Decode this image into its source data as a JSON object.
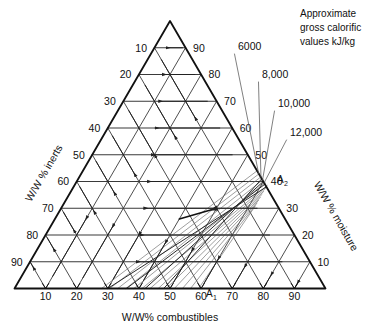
{
  "figure": {
    "type": "ternary-diagram",
    "background": "#ffffff",
    "ink": "#111111",
    "grid_color": "#3a3a3a",
    "calorific_line_color": "#6b6b6b"
  },
  "axes": {
    "left": {
      "title": "W/W % inerts",
      "ticks": [
        "10",
        "20",
        "30",
        "40",
        "50",
        "60",
        "70",
        "80",
        "90"
      ]
    },
    "right": {
      "title": "W/W % moisture",
      "ticks": [
        "90",
        "80",
        "70",
        "60",
        "50",
        "40",
        "30",
        "20",
        "10"
      ]
    },
    "bottom": {
      "title": "W/W% combustibles",
      "ticks": [
        "10",
        "20",
        "30",
        "40",
        "50",
        "60",
        "70",
        "80",
        "90"
      ]
    }
  },
  "legend": {
    "line1": "Approximate",
    "line2": "gross calorific",
    "line3": "values kJ/kg"
  },
  "calorific_labels": [
    {
      "text": "6000",
      "x": 238,
      "y": 50
    },
    {
      "text": "8,000",
      "x": 262,
      "y": 78
    },
    {
      "text": "10,000",
      "x": 278,
      "y": 107
    },
    {
      "text": "12,000",
      "x": 290,
      "y": 136
    }
  ],
  "points": [
    {
      "id": "A1",
      "base": "A",
      "sub": "1",
      "x": 206,
      "y": 297
    },
    {
      "id": "A2",
      "base": "A",
      "sub": "2",
      "x": 277,
      "y": 183
    }
  ],
  "chart_data": {
    "type": "ternary",
    "title": "Approximate gross calorific values kJ/kg",
    "components": [
      "combustibles",
      "inerts",
      "moisture"
    ],
    "axis_labels": {
      "bottom": "W/W% combustibles",
      "left": "W/W % inerts",
      "right": "W/W % moisture"
    },
    "tick_interval": 10,
    "tick_range": [
      10,
      90
    ],
    "grid": true,
    "contours": [
      {
        "label": "6000",
        "value": 6000,
        "units": "kJ/kg"
      },
      {
        "label": "8,000",
        "value": 8000,
        "units": "kJ/kg"
      },
      {
        "label": "10,000",
        "value": 10000,
        "units": "kJ/kg"
      },
      {
        "label": "12,000",
        "value": 12000,
        "units": "kJ/kg"
      }
    ],
    "annotated_points": [
      {
        "label": "A1",
        "combustibles": 64,
        "inerts": 0,
        "moisture": 36
      },
      {
        "label": "A2",
        "combustibles": 60,
        "inerts": 0,
        "moisture": 40
      }
    ]
  }
}
